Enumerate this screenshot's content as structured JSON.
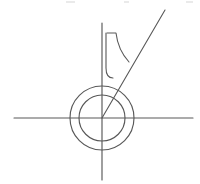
{
  "figure": {
    "background_color": "#ffffff",
    "stroke_color": "#585858",
    "width": 200,
    "height": 184,
    "origin": {
      "x": 102,
      "y": 118
    },
    "axes": {
      "horizontal": {
        "label": "horizontal-axis",
        "x1": 14,
        "y1": 118,
        "x2": 193,
        "y2": 118
      },
      "vertical": {
        "label": "vertical-axis",
        "x1": 102,
        "y1": 23,
        "x2": 102,
        "y2": 180
      }
    },
    "circles": [
      {
        "label": "outer-circle",
        "cx": 102,
        "cy": 118,
        "r": 32
      },
      {
        "label": "inner-circle",
        "cx": 102,
        "cy": 118,
        "r": 23
      }
    ],
    "ray": {
      "label": "diagonal-ray",
      "x1": 102,
      "y1": 118,
      "x2": 165,
      "y2": 10
    },
    "hook": {
      "label": "j-hook-stroke",
      "path": "M 106 33 L 106 68 Q 106 78 113 78"
    },
    "curve": {
      "label": "arc-curve",
      "path": "M 107 33 L 116 33 Q 118 50 129 62"
    },
    "top_artifacts": [
      {
        "x": 66,
        "width": 9
      },
      {
        "x": 124,
        "width": 5
      },
      {
        "x": 186,
        "width": 7
      }
    ]
  }
}
